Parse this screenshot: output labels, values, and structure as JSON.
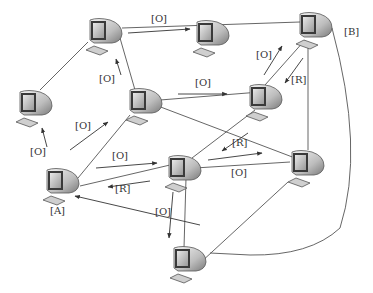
{
  "diagram": {
    "type": "network-graph",
    "node_icon": "computer-icon",
    "colors": {
      "line": "#555555",
      "text": "#333333",
      "background": "#ffffff"
    },
    "nodes": [
      {
        "id": "n1",
        "label": "",
        "x": 88,
        "y": 18
      },
      {
        "id": "n2",
        "label": "",
        "x": 195,
        "y": 20
      },
      {
        "id": "n3",
        "label": "[B]",
        "x": 298,
        "y": 12
      },
      {
        "id": "n4",
        "label": "",
        "x": 18,
        "y": 90
      },
      {
        "id": "n5",
        "label": "",
        "x": 128,
        "y": 88
      },
      {
        "id": "n6",
        "label": "",
        "x": 248,
        "y": 84
      },
      {
        "id": "n7",
        "label": "[A]",
        "x": 45,
        "y": 168
      },
      {
        "id": "n8",
        "label": "",
        "x": 167,
        "y": 155
      },
      {
        "id": "n9",
        "label": "",
        "x": 290,
        "y": 150
      },
      {
        "id": "n10",
        "label": "",
        "x": 172,
        "y": 246
      }
    ],
    "edge_labels": [
      {
        "text": "[O]",
        "x": 151,
        "y": 17
      },
      {
        "text": "[O]",
        "x": 256,
        "y": 50
      },
      {
        "text": "[R]",
        "x": 291,
        "y": 75
      },
      {
        "text": "[O]",
        "x": 99,
        "y": 74
      },
      {
        "text": "[O]",
        "x": 195,
        "y": 81
      },
      {
        "text": "[O]",
        "x": 75,
        "y": 123
      },
      {
        "text": "[O]",
        "x": 30,
        "y": 148
      },
      {
        "text": "[O]",
        "x": 112,
        "y": 152
      },
      {
        "text": "[R]",
        "x": 115,
        "y": 184
      },
      {
        "text": "[R]",
        "x": 232,
        "y": 138
      },
      {
        "text": "[O]",
        "x": 231,
        "y": 168
      },
      {
        "text": "[O]",
        "x": 155,
        "y": 208
      },
      {
        "text": "[A]",
        "x": 50,
        "y": 208
      },
      {
        "text": "[B]",
        "x": 344,
        "y": 28
      }
    ]
  }
}
